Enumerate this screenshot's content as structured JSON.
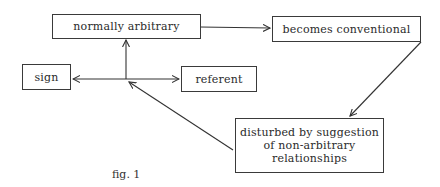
{
  "diagram": {
    "nodes": {
      "normally_arbitrary": {
        "label": "normally arbitrary"
      },
      "becomes_conventional": {
        "label": "becomes conventional"
      },
      "sign": {
        "label": "sign"
      },
      "referent": {
        "label": "referent"
      },
      "disturbed": {
        "lines": [
          "disturbed by suggestion",
          "of non-arbitrary",
          "relationships"
        ]
      }
    },
    "edges": [
      {
        "from": "sign-referent-link",
        "to": "normally arbitrary"
      },
      {
        "from": "normally arbitrary",
        "to": "becomes conventional"
      },
      {
        "from": "becomes conventional",
        "to": "disturbed by suggestion of non-arbitrary relationships"
      },
      {
        "from": "disturbed by suggestion of non-arbitrary relationships",
        "to": "sign-referent-link"
      },
      {
        "from": "sign-referent-link",
        "to": "sign"
      },
      {
        "from": "sign-referent-link",
        "to": "referent"
      }
    ],
    "caption": "fig. 1"
  }
}
